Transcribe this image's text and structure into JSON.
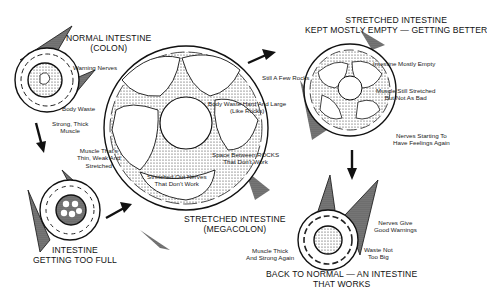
{
  "diagram": {
    "stages": [
      {
        "id": "normal",
        "title": [
          "NORMAL INTESTINE",
          "(COLON)"
        ],
        "labels": [
          {
            "text": [
              "Warning Nerves"
            ]
          },
          {
            "text": [
              "Body Waste"
            ]
          },
          {
            "text": [
              "Strong, Thick",
              "Muscle"
            ]
          }
        ]
      },
      {
        "id": "too-full",
        "title": [
          "INTESTINE",
          "GETTING TOO FULL"
        ],
        "labels": [
          {
            "text": [
              "Muscle That's",
              "Thin, Weak And",
              "Stretched"
            ]
          }
        ]
      },
      {
        "id": "megacolon",
        "title": [
          "STRETCHED INTESTINE",
          "(MEGACOLON)"
        ],
        "labels": [
          {
            "text": [
              "Body Waste Hard And Large",
              "(Like Rocks)"
            ]
          },
          {
            "text": [
              "Space Between ROCKS",
              "That Don't Work"
            ]
          },
          {
            "text": [
              "Stretched Out Nerves",
              "That Don't Work"
            ]
          }
        ]
      },
      {
        "id": "getting-better",
        "title": [
          "STRETCHED INTESTINE",
          "KEPT MOSTLY EMPTY — GETTING BETTER"
        ],
        "labels": [
          {
            "text": [
              "Still A Few Rocks"
            ]
          },
          {
            "text": [
              "Intestine Mostly Empty"
            ]
          },
          {
            "text": [
              "Muscle Still Stretched",
              "But Not As Bad"
            ]
          },
          {
            "text": [
              "Nerves Starting To",
              "Have Feelings Again"
            ]
          }
        ]
      },
      {
        "id": "back-to-normal",
        "title": [
          "BACK TO NORMAL — AN INTESTINE",
          "THAT WORKS"
        ],
        "labels": [
          {
            "text": [
              "Nerves Give",
              "Good Warnings"
            ]
          },
          {
            "text": [
              "Waste Not",
              "Too Big"
            ]
          },
          {
            "text": [
              "Muscle Thick",
              "And Strong Again"
            ]
          }
        ]
      }
    ],
    "arrows": [
      {
        "from": "normal",
        "to": "too-full",
        "icon": "arrow-down-icon"
      },
      {
        "from": "too-full",
        "to": "megacolon",
        "icon": "arrow-up-right-icon"
      },
      {
        "from": "megacolon",
        "to": "getting-better",
        "icon": "arrow-up-right-icon"
      },
      {
        "from": "getting-better",
        "to": "back-to-normal",
        "icon": "arrow-down-icon"
      }
    ],
    "colors": {
      "ink": "#111111",
      "background": "#ffffff",
      "stipple": "#555555"
    }
  }
}
